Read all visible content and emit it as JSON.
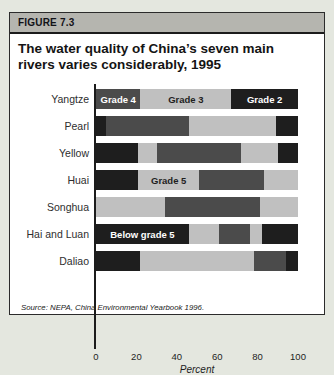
{
  "page": {
    "background": "#e4e7df"
  },
  "figure": {
    "tag": "FIGURE 7.3",
    "title_line1": "The water quality of China’s seven main",
    "title_line2": "rivers varies considerably, 1995",
    "source_prefix": "Source: NEPA, ",
    "source_title": "China Environmental Yearbook 1996."
  },
  "chart_data": {
    "type": "bar",
    "subtype": "horizontal-stacked",
    "title": "The water quality of China’s seven main rivers varies considerably, 1995",
    "xlabel": "Percent",
    "xlim": [
      0,
      100
    ],
    "xticks": [
      0,
      20,
      40,
      60,
      80,
      100
    ],
    "grid": false,
    "legend": "labels printed inside bar segments",
    "palette": {
      "black": "#1e1e1e",
      "dark": "#4b4b4b",
      "light": "#c0c0c0"
    },
    "label_colors": {
      "on_dark": "#ffffff",
      "on_light": "#1e1e1e"
    },
    "categories": [
      "Yangtze",
      "Pearl",
      "Yellow",
      "Huai",
      "Songhua",
      "Hai and Luan",
      "Daliao"
    ],
    "bars": [
      {
        "river": "Yangtze",
        "segments": [
          {
            "shade": "dark",
            "value": 22,
            "label": "Grade 4",
            "label_on": "on_dark"
          },
          {
            "shade": "light",
            "value": 45,
            "label": "Grade 3",
            "label_on": "on_light"
          },
          {
            "shade": "black",
            "value": 33,
            "label": "Grade 2",
            "label_on": "on_dark"
          }
        ]
      },
      {
        "river": "Pearl",
        "segments": [
          {
            "shade": "black",
            "value": 5
          },
          {
            "shade": "dark",
            "value": 41
          },
          {
            "shade": "light",
            "value": 43
          },
          {
            "shade": "black",
            "value": 11
          }
        ]
      },
      {
        "river": "Yellow",
        "segments": [
          {
            "shade": "black",
            "value": 21
          },
          {
            "shade": "light",
            "value": 9
          },
          {
            "shade": "dark",
            "value": 42
          },
          {
            "shade": "light",
            "value": 18
          },
          {
            "shade": "black",
            "value": 10
          }
        ]
      },
      {
        "river": "Huai",
        "segments": [
          {
            "shade": "black",
            "value": 21
          },
          {
            "shade": "light",
            "value": 30,
            "label": "Grade 5",
            "label_on": "on_light"
          },
          {
            "shade": "dark",
            "value": 32
          },
          {
            "shade": "light",
            "value": 17
          }
        ]
      },
      {
        "river": "Songhua",
        "segments": [
          {
            "shade": "light",
            "value": 34
          },
          {
            "shade": "dark",
            "value": 47
          },
          {
            "shade": "light",
            "value": 19
          }
        ]
      },
      {
        "river": "Hai and Luan",
        "segments": [
          {
            "shade": "black",
            "value": 46,
            "label": "Below grade 5",
            "label_on": "on_dark"
          },
          {
            "shade": "light",
            "value": 15
          },
          {
            "shade": "dark",
            "value": 15
          },
          {
            "shade": "light",
            "value": 6
          },
          {
            "shade": "black",
            "value": 18
          }
        ]
      },
      {
        "river": "Daliao",
        "segments": [
          {
            "shade": "black",
            "value": 22
          },
          {
            "shade": "light",
            "value": 56
          },
          {
            "shade": "dark",
            "value": 16
          },
          {
            "shade": "black",
            "value": 6
          }
        ]
      }
    ]
  }
}
